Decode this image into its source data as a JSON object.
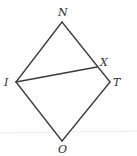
{
  "diagram": {
    "type": "geometry-figure",
    "shape": "quadrilateral (rhombus) NTOI with segment IX",
    "colors": {
      "stroke": "#3a3a3a",
      "label": "#2a2a2a",
      "background": "#ffffff"
    },
    "points": {
      "N": {
        "label": "N",
        "x": 62,
        "y": 22
      },
      "T": {
        "label": "T",
        "x": 110,
        "y": 82
      },
      "O": {
        "label": "O",
        "x": 62,
        "y": 141
      },
      "I": {
        "label": "I",
        "x": 16,
        "y": 82
      },
      "X": {
        "label": "X",
        "x": 97,
        "y": 67
      }
    },
    "segments": [
      {
        "from": "N",
        "to": "T"
      },
      {
        "from": "T",
        "to": "O"
      },
      {
        "from": "O",
        "to": "I"
      },
      {
        "from": "I",
        "to": "N"
      },
      {
        "from": "I",
        "to": "X"
      }
    ],
    "labels": {
      "N": "N",
      "T": "T",
      "O": "O",
      "I": "I",
      "X": "X"
    }
  }
}
